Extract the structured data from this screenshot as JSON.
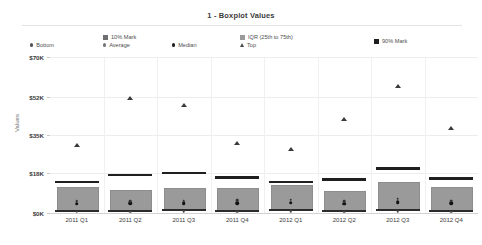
{
  "header": {
    "title": "1 - Boxplot Values"
  },
  "legend": {
    "items": [
      {
        "label": "Bottom",
        "marker": "dot",
        "color": "#555555"
      },
      {
        "label": "10% Mark",
        "marker": "square",
        "color": "#6f6f6f"
      },
      {
        "label": "Average",
        "marker": "dot",
        "color": "#777777"
      },
      {
        "label": "Median",
        "marker": "dot",
        "color": "#222222"
      },
      {
        "label": "IQR (25th to 75th)",
        "marker": "square",
        "color": "#9a9a9a"
      },
      {
        "label": "Top",
        "marker": "triangle",
        "color": "#4a4a4a"
      },
      {
        "label": "90% Mark",
        "marker": "square",
        "color": "#1f1f1f"
      }
    ]
  },
  "axes": {
    "y_label": "Values",
    "y_ticks": [
      "$70K",
      "$52K",
      "$35K",
      "$18K",
      "$0K"
    ]
  },
  "chart_data": {
    "type": "boxplot",
    "title": "1 - Boxplot Values",
    "xlabel": "",
    "ylabel": "Values",
    "ylim": [
      0,
      70000
    ],
    "ytick_values": [
      0,
      18000,
      35000,
      52000,
      70000
    ],
    "ytick_labels": [
      "$0K",
      "$18K",
      "$35K",
      "$52K",
      "$70K"
    ],
    "grid": true,
    "legend_position": "top",
    "categories": [
      "2011 Q1",
      "2011 Q2",
      "2011 Q3",
      "2011 Q4",
      "2012 Q1",
      "2012 Q2",
      "2012 Q3",
      "2012 Q4"
    ],
    "series": [
      {
        "name": "Bottom",
        "values": [
          600,
          600,
          700,
          600,
          700,
          600,
          700,
          600
        ]
      },
      {
        "name": "10% Mark",
        "values": [
          1400,
          1500,
          1600,
          1500,
          1700,
          1400,
          1700,
          1500
        ]
      },
      {
        "name": "Average",
        "values": [
          5200,
          5400,
          5600,
          5800,
          6000,
          5200,
          6400,
          5600
        ]
      },
      {
        "name": "Median",
        "values": [
          4200,
          4300,
          4400,
          4500,
          4600,
          4200,
          4800,
          4400
        ]
      },
      {
        "name": "IQR 25th percentile",
        "values": [
          1800,
          1900,
          2000,
          1900,
          2100,
          1800,
          2200,
          1900
        ]
      },
      {
        "name": "IQR 75th percentile",
        "values": [
          11500,
          10500,
          11000,
          11000,
          12500,
          10000,
          14000,
          11500
        ]
      },
      {
        "name": "90% Mark",
        "values": [
          14500,
          17500,
          18500,
          16500,
          14500,
          15500,
          20500,
          16000
        ]
      },
      {
        "name": "Top",
        "values": [
          30500,
          51500,
          48500,
          31500,
          28500,
          42000,
          57000,
          38000
        ]
      }
    ]
  },
  "boxes": [
    {
      "category": "2011 Q1",
      "bottom": 600,
      "p10": 1400,
      "q1": 1800,
      "median": 4200,
      "average": 5200,
      "q3": 11500,
      "p90": 14500,
      "top": 30500
    },
    {
      "category": "2011 Q2",
      "bottom": 600,
      "p10": 1500,
      "q1": 1900,
      "median": 4300,
      "average": 5400,
      "q3": 10500,
      "p90": 17500,
      "top": 51500
    },
    {
      "category": "2011 Q3",
      "bottom": 700,
      "p10": 1600,
      "q1": 2000,
      "median": 4400,
      "average": 5600,
      "q3": 11000,
      "p90": 18500,
      "top": 48500
    },
    {
      "category": "2011 Q4",
      "bottom": 600,
      "p10": 1500,
      "q1": 1900,
      "median": 4500,
      "average": 5800,
      "q3": 11000,
      "p90": 16500,
      "top": 31500
    },
    {
      "category": "2012 Q1",
      "bottom": 700,
      "p10": 1700,
      "q1": 2100,
      "median": 4600,
      "average": 6000,
      "q3": 12500,
      "p90": 14500,
      "top": 28500
    },
    {
      "category": "2012 Q2",
      "bottom": 600,
      "p10": 1400,
      "q1": 1800,
      "median": 4200,
      "average": 5200,
      "q3": 10000,
      "p90": 15500,
      "top": 42000
    },
    {
      "category": "2012 Q3",
      "bottom": 700,
      "p10": 1700,
      "q1": 2200,
      "median": 4800,
      "average": 6400,
      "q3": 14000,
      "p90": 20500,
      "top": 57000
    },
    {
      "category": "2012 Q4",
      "bottom": 600,
      "p10": 1500,
      "q1": 1900,
      "median": 4400,
      "average": 5600,
      "q3": 11500,
      "p90": 16000,
      "top": 38000
    }
  ]
}
